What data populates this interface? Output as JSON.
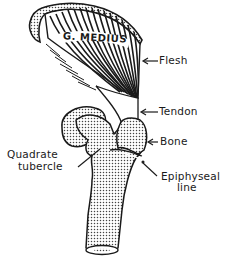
{
  "diagram": {
    "muscle_label": "G. MEDIUS",
    "labels": {
      "flesh": "Flesh",
      "tendon": "Tendon",
      "bone": "Bone",
      "quadrate_tubercle_line1": "Quadrate",
      "quadrate_tubercle_line2": "tubercle",
      "epiphyseal_line1": "Epiphyseal",
      "epiphyseal_line2": "line"
    },
    "colors": {
      "ink": "#1a1a1a",
      "background": "#ffffff",
      "stipple": "#555555"
    }
  }
}
